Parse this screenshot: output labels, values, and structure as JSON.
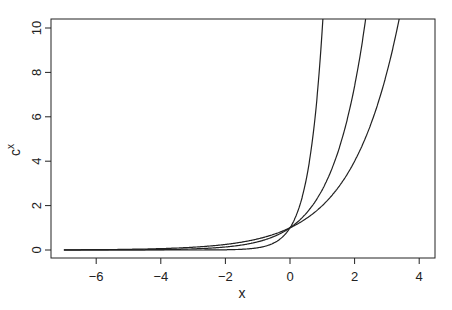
{
  "chart_data": {
    "type": "line",
    "title": "",
    "xlabel": "x",
    "ylabel": "c^x",
    "xlim": [
      -7.2,
      4.5
    ],
    "ylim": [
      -0.3,
      10.4
    ],
    "x_ticks": [
      -6,
      -4,
      -2,
      0,
      2,
      4
    ],
    "y_ticks": [
      0,
      2,
      4,
      6,
      8,
      10
    ],
    "x_range": [
      -7,
      4
    ],
    "grid": false,
    "legend": null,
    "series": [
      {
        "name": "2^x",
        "base": 2
      },
      {
        "name": "e^x",
        "base": 2.718
      },
      {
        "name": "10^x",
        "base": 10
      }
    ]
  },
  "labels": {
    "xlabel": "x",
    "ylabel_base": "c",
    "ylabel_exp": "x"
  }
}
